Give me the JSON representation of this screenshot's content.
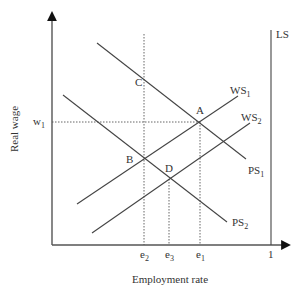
{
  "diagram": {
    "title": "",
    "axes": {
      "x_label": "Employment rate",
      "y_label": "Real wage",
      "x_ticks": [
        {
          "id": "e2",
          "base": "e",
          "sub": "2"
        },
        {
          "id": "e3",
          "base": "e",
          "sub": "3"
        },
        {
          "id": "e1",
          "base": "e",
          "sub": "1"
        },
        {
          "id": "one",
          "base": "1",
          "sub": ""
        }
      ],
      "y_ticks": [
        {
          "id": "w1",
          "base": "w",
          "sub": "1"
        }
      ]
    },
    "curves": {
      "ls": {
        "base": "LS",
        "sub": ""
      },
      "ws1": {
        "base": "WS",
        "sub": "1"
      },
      "ws2": {
        "base": "WS",
        "sub": "2"
      },
      "ps1": {
        "base": "PS",
        "sub": "1"
      },
      "ps2": {
        "base": "PS",
        "sub": "2"
      }
    },
    "points": {
      "a": "A",
      "b": "B",
      "c": "C",
      "d": "D"
    }
  }
}
